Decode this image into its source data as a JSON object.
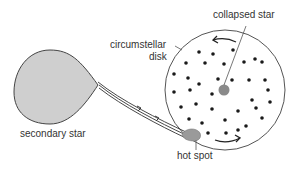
{
  "diagram": {
    "labels": {
      "collapsed_star": "collapsed star",
      "disk_line1": "circumstellar",
      "disk_line2": "disk",
      "secondary_star": "secondary star",
      "hot_spot": "hot spot"
    },
    "colors": {
      "secondary_star_fill": "#cfcfcf",
      "collapsed_star_fill": "#8a8a8a",
      "hot_spot_fill": "#9a9a9a",
      "outline": "#444444",
      "dots": "#1a1a1a",
      "text": "#333333"
    },
    "disk": {
      "cx": 225,
      "cy": 90,
      "r": 60
    },
    "dots": [
      [
        199,
        52
      ],
      [
        213,
        54
      ],
      [
        233,
        50
      ],
      [
        255,
        59
      ],
      [
        186,
        63
      ],
      [
        205,
        63
      ],
      [
        224,
        64
      ],
      [
        244,
        62
      ],
      [
        262,
        62
      ],
      [
        174,
        74
      ],
      [
        188,
        78
      ],
      [
        199,
        84
      ],
      [
        218,
        79
      ],
      [
        232,
        80
      ],
      [
        249,
        80
      ],
      [
        265,
        80
      ],
      [
        174,
        92
      ],
      [
        190,
        90
      ],
      [
        212,
        94
      ],
      [
        252,
        100
      ],
      [
        268,
        90
      ],
      [
        270,
        102
      ],
      [
        181,
        107
      ],
      [
        196,
        104
      ],
      [
        212,
        109
      ],
      [
        238,
        111
      ],
      [
        256,
        108
      ],
      [
        262,
        118
      ],
      [
        189,
        119
      ],
      [
        202,
        123
      ],
      [
        225,
        120
      ],
      [
        246,
        126
      ],
      [
        208,
        133
      ],
      [
        226,
        133
      ],
      [
        238,
        130
      ]
    ]
  }
}
